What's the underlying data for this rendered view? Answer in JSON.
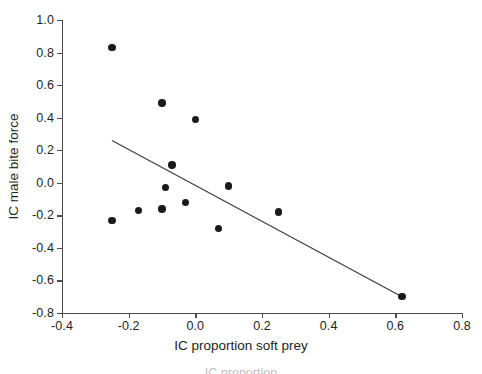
{
  "chart_data": {
    "type": "scatter",
    "title": "",
    "xlabel": "IC proportion soft prey",
    "ylabel": "IC male bite force",
    "xlim": [
      -0.4,
      0.8
    ],
    "ylim": [
      -0.8,
      1.0
    ],
    "xticks": [
      -0.4,
      -0.2,
      0.0,
      0.2,
      0.4,
      0.6,
      0.8
    ],
    "xticklabels": [
      "-0.4",
      "-0.2",
      "0.0",
      "0.2",
      "0.4",
      "0.6",
      "0.8"
    ],
    "yticks": [
      -0.8,
      -0.6,
      -0.4,
      -0.2,
      0.0,
      0.2,
      0.4,
      0.6,
      0.8,
      1.0
    ],
    "yticklabels": [
      "-0.8",
      "-0.6",
      "-0.4",
      "-0.2",
      "0.0",
      "0.2",
      "0.4",
      "0.6",
      "0.8",
      "1.0"
    ],
    "grid": false,
    "legend": null,
    "marker": "filled-circle",
    "marker_color": "#1a1a1a",
    "points": [
      {
        "x": -0.25,
        "y": 0.83
      },
      {
        "x": -0.1,
        "y": 0.49
      },
      {
        "x": 0.0,
        "y": 0.39
      },
      {
        "x": -0.07,
        "y": 0.11
      },
      {
        "x": -0.09,
        "y": -0.03
      },
      {
        "x": 0.1,
        "y": -0.02
      },
      {
        "x": -0.03,
        "y": -0.12
      },
      {
        "x": -0.1,
        "y": -0.16
      },
      {
        "x": -0.17,
        "y": -0.17
      },
      {
        "x": 0.25,
        "y": -0.18
      },
      {
        "x": -0.25,
        "y": -0.23
      },
      {
        "x": 0.07,
        "y": -0.28
      },
      {
        "x": 0.62,
        "y": -0.7
      }
    ],
    "trendline": {
      "type": "linear-fit",
      "x_start": -0.25,
      "y_start": 0.26,
      "x_end": 0.62,
      "y_end": -0.7,
      "color": "#3f3f3f"
    }
  },
  "axes": {
    "x_title": "IC proportion soft prey",
    "y_title": "IC male bite force"
  },
  "caption": {
    "text": "IC proportion"
  }
}
